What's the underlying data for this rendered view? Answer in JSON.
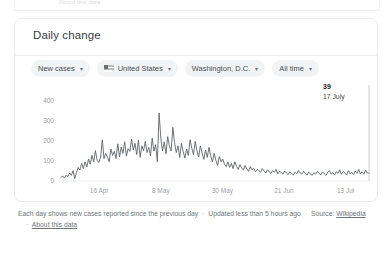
{
  "top_partial_link": "About this data",
  "card": {
    "title": "Daily change",
    "chips": [
      {
        "label": "New cases",
        "icon": null,
        "caret": "▾"
      },
      {
        "label": "United States",
        "icon": "us-flag-icon",
        "caret": "▾"
      },
      {
        "label": "Washington, D.C.",
        "icon": null,
        "caret": "▾"
      },
      {
        "label": "All time",
        "icon": null,
        "caret": "▾"
      }
    ]
  },
  "tooltip": {
    "value": "39",
    "date": "17 July"
  },
  "footer": {
    "description": "Each day shows new cases reported since the previous day",
    "updated": "Updated less than 5 hours ago",
    "source_label": "Source:",
    "source_link": "Wikipedia",
    "about_link": "About this data",
    "separator": "·"
  },
  "colors": {
    "line": "#5f6368",
    "chip_bg": "#f1f3f4",
    "axis_text": "#9aa0a6",
    "card_border": "#ececec"
  },
  "chart_data": {
    "type": "line",
    "title": "Daily change",
    "xlabel": "",
    "ylabel": "",
    "ylim": [
      0,
      420
    ],
    "yticks": [
      0,
      100,
      200,
      300,
      400
    ],
    "ytick_labels": [
      "0",
      "100",
      "200",
      "300",
      "400"
    ],
    "xticks": [
      "16 Apr",
      "8 May",
      "30 May",
      "21 Jun",
      "13 Jul"
    ],
    "grid": false,
    "legend": "none",
    "series_name": "New cases",
    "annotation": {
      "x": "17 July",
      "y": 39,
      "label": "39"
    },
    "values": [
      18,
      25,
      14,
      30,
      22,
      40,
      28,
      52,
      12,
      44,
      68,
      55,
      88,
      62,
      96,
      70,
      110,
      84,
      128,
      96,
      152,
      104,
      92,
      118,
      206,
      112,
      138,
      120,
      96,
      160,
      128,
      148,
      112,
      186,
      120,
      170,
      138,
      196,
      124,
      162,
      148,
      210,
      156,
      188,
      132,
      204,
      118,
      176,
      152,
      198,
      142,
      168,
      126,
      214,
      150,
      182,
      96,
      340,
      214,
      150,
      196,
      136,
      222,
      176,
      150,
      268,
      192,
      142,
      176,
      118,
      188,
      148,
      114,
      160,
      128,
      206,
      164,
      132,
      198,
      152,
      120,
      176,
      140,
      108,
      154,
      118,
      168,
      126,
      96,
      138,
      104,
      78,
      122,
      96,
      110,
      84,
      72,
      96,
      68,
      88,
      62,
      96,
      74,
      58,
      82,
      66,
      54,
      78,
      60,
      48,
      72,
      56,
      64,
      46,
      58,
      52,
      44,
      62,
      50,
      40,
      56,
      46,
      38,
      52,
      44,
      58,
      36,
      48,
      42,
      34,
      50,
      40,
      32,
      46,
      38,
      30,
      44,
      36,
      52,
      40,
      34,
      48,
      38,
      30,
      44,
      36,
      28,
      42,
      34,
      48,
      38,
      30,
      46,
      36,
      28,
      44,
      52,
      34,
      42,
      30,
      46,
      38,
      56,
      34,
      48,
      40,
      30,
      52,
      36,
      44,
      32,
      50,
      38,
      58,
      36,
      46,
      34,
      54,
      40,
      39
    ]
  }
}
